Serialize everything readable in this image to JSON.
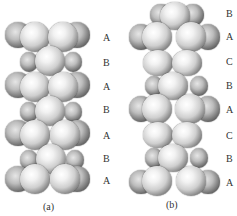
{
  "figure": {
    "panels": [
      {
        "id": "a",
        "caption": "(a)",
        "layers": [
          "A",
          "B",
          "A",
          "B",
          "A",
          "B",
          "A"
        ]
      },
      {
        "id": "b",
        "caption": "(b)",
        "layers": [
          "B",
          "A",
          "C",
          "B",
          "A",
          "C",
          "B",
          "A"
        ]
      }
    ]
  },
  "labels": {
    "a": [
      "A",
      "B",
      "A",
      "B",
      "A",
      "B",
      "A"
    ],
    "b": [
      "B",
      "A",
      "C",
      "B",
      "A",
      "C",
      "B",
      "A"
    ]
  }
}
